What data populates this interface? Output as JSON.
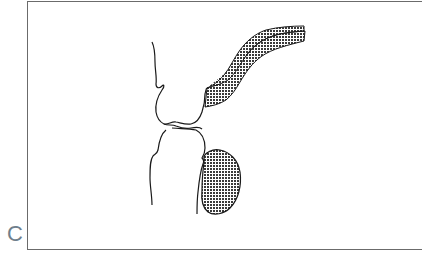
{
  "figure": {
    "panel_label": "C",
    "frame_color": "#6b6b6b",
    "label_color": "#6f7f8c",
    "stroke_color": "#1a1a1a",
    "hatch_color": "#3a3a3a",
    "elements": [
      {
        "name": "upper-outline",
        "type": "line-drawing"
      },
      {
        "name": "upper-curved-band",
        "type": "hatched-band"
      },
      {
        "name": "lower-outline",
        "type": "line-drawing"
      },
      {
        "name": "lower-oval-mass",
        "type": "hatched-oval"
      }
    ]
  }
}
